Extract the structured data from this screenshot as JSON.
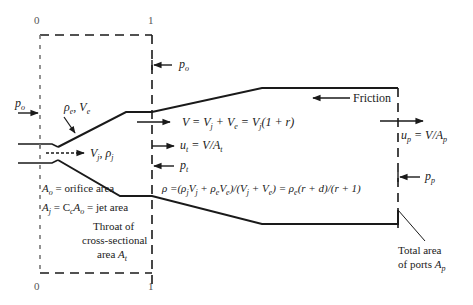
{
  "figure": {
    "station_labels": {
      "top_0": "0",
      "top_1": "1",
      "bottom_0": "0",
      "bottom_1": "1"
    },
    "inlet": {
      "po_left_sym": "p",
      "po_left_sub": "o",
      "entrained": "ρ",
      "entrained_sub": "e",
      "entrained_sep": ", ",
      "entrained_v": "V",
      "entrained_v_sub": "e",
      "jet_v": "V",
      "jet_v_sub": "j",
      "jet_sep": ", ",
      "jet_rho": "ρ",
      "jet_rho_sub": "j"
    },
    "station1": {
      "po_sym": "p",
      "po_sub": "o",
      "ut_sym": "u",
      "ut_sub": "t",
      "ut_rest": " = V/A",
      "ut_rest_sub": "t",
      "pt_sym": "p",
      "pt_sub": "t"
    },
    "equations": {
      "velocity": "V = V",
      "velocity_parts": [
        "V  =  V",
        "j",
        " + V",
        "e",
        "  =  V",
        "j",
        "(1 + r)"
      ],
      "density_parts": [
        "ρ =(ρ",
        "j",
        "V",
        "j",
        " + ρ",
        "e",
        "V",
        "e",
        ")/(V",
        "j",
        " + V",
        "e",
        ") = ρ",
        "e",
        "(r + d)/(r + 1)"
      ]
    },
    "outlet": {
      "friction": "Friction",
      "up_sym": "u",
      "up_sub": "p",
      "up_rest": " = V/A",
      "up_rest_sub": "p",
      "pp_sym": "p",
      "pp_sub": "p"
    },
    "notes": {
      "ao_sym": "A",
      "ao_sub": "o",
      "ao_text": " = orifice area",
      "aj_sym": "A",
      "aj_sub": "j",
      "aj_mid": " = C",
      "aj_mid_sub": "c",
      "aj_a": "A",
      "aj_a_sub": "o",
      "aj_text": " = jet area",
      "throat_line1": "Throat of",
      "throat_line2": "cross-sectional",
      "throat_line3": "area ",
      "throat_sym": "A",
      "throat_sub": "t",
      "ports_line1": "Total area",
      "ports_line2": "of ports ",
      "ports_sym": "A",
      "ports_sub": "p"
    },
    "colors": {
      "ink": "#1a1a1a",
      "tick": "#555555",
      "background": "#ffffff"
    }
  }
}
